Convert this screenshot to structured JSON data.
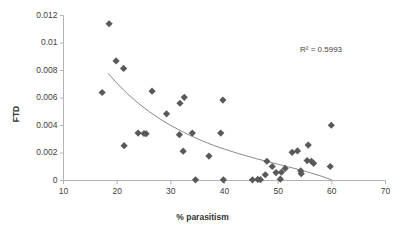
{
  "chart_data": {
    "type": "scatter",
    "title": "",
    "xlabel": "% parasitism",
    "ylabel": "FTD",
    "xlim": [
      10,
      70
    ],
    "ylim": [
      0,
      0.012
    ],
    "xticks": [
      10,
      20,
      30,
      40,
      50,
      60,
      70
    ],
    "yticks": [
      0,
      0.002,
      0.004,
      0.006,
      0.008,
      0.01,
      0.012
    ],
    "xtick_labels": [
      "10",
      "20",
      "30",
      "40",
      "50",
      "60",
      "70"
    ],
    "ytick_labels": [
      "0",
      "0.002",
      "0.004",
      "0.006",
      "0.008",
      "0.01",
      "0.012"
    ],
    "grid": false,
    "legend": null,
    "marker_color": "#595959",
    "marker_shape": "diamond",
    "trendline_color": "#7d7d7d",
    "annotations": [
      {
        "text": "R² = 0.5993",
        "x": 63.5,
        "y": 0.0098
      }
    ],
    "points": [
      {
        "x": 17.2,
        "y": 0.0064
      },
      {
        "x": 18.5,
        "y": 0.0114
      },
      {
        "x": 19.8,
        "y": 0.0087
      },
      {
        "x": 21.2,
        "y": 0.00815
      },
      {
        "x": 21.3,
        "y": 0.00253
      },
      {
        "x": 23.9,
        "y": 0.00345
      },
      {
        "x": 25.0,
        "y": 0.00342
      },
      {
        "x": 25.4,
        "y": 0.0034
      },
      {
        "x": 26.5,
        "y": 0.0065
      },
      {
        "x": 29.2,
        "y": 0.00485
      },
      {
        "x": 31.7,
        "y": 0.00562
      },
      {
        "x": 31.6,
        "y": 0.00333
      },
      {
        "x": 32.5,
        "y": 0.00605
      },
      {
        "x": 32.3,
        "y": 0.00213
      },
      {
        "x": 34.0,
        "y": 0.00345
      },
      {
        "x": 34.6,
        "y": 5e-05
      },
      {
        "x": 37.1,
        "y": 0.00178
      },
      {
        "x": 39.3,
        "y": 0.00345
      },
      {
        "x": 39.8,
        "y": 5e-05
      },
      {
        "x": 39.7,
        "y": 0.00585
      },
      {
        "x": 45.2,
        "y": 5e-05
      },
      {
        "x": 46.2,
        "y": 8e-05
      },
      {
        "x": 46.7,
        "y": 6e-05
      },
      {
        "x": 47.6,
        "y": 0.00042
      },
      {
        "x": 47.9,
        "y": 0.0014
      },
      {
        "x": 48.9,
        "y": 0.00102
      },
      {
        "x": 49.6,
        "y": 0.00058
      },
      {
        "x": 50.4,
        "y": 0.0001
      },
      {
        "x": 50.6,
        "y": 0.0006
      },
      {
        "x": 51.3,
        "y": 0.00088
      },
      {
        "x": 52.6,
        "y": 0.00205
      },
      {
        "x": 53.6,
        "y": 0.00215
      },
      {
        "x": 54.2,
        "y": 0.0007
      },
      {
        "x": 54.3,
        "y": 0.0005
      },
      {
        "x": 55.6,
        "y": 0.00258
      },
      {
        "x": 55.4,
        "y": 0.00145
      },
      {
        "x": 56.2,
        "y": 0.0014
      },
      {
        "x": 56.6,
        "y": 0.00125
      },
      {
        "x": 59.9,
        "y": 0.00402
      },
      {
        "x": 59.7,
        "y": 0.00102
      }
    ],
    "trendline": {
      "type": "power",
      "r_squared": 0.5993,
      "points": [
        {
          "x": 18.3,
          "y": 0.0078
        },
        {
          "x": 20.0,
          "y": 0.00705
        },
        {
          "x": 22.0,
          "y": 0.00628
        },
        {
          "x": 24.0,
          "y": 0.0056
        },
        {
          "x": 26.0,
          "y": 0.005
        },
        {
          "x": 28.0,
          "y": 0.00447
        },
        {
          "x": 30.0,
          "y": 0.004
        },
        {
          "x": 32.0,
          "y": 0.00358
        },
        {
          "x": 34.0,
          "y": 0.0032
        },
        {
          "x": 36.0,
          "y": 0.00286
        },
        {
          "x": 38.0,
          "y": 0.00255
        },
        {
          "x": 40.0,
          "y": 0.00228
        },
        {
          "x": 42.0,
          "y": 0.00203
        },
        {
          "x": 44.0,
          "y": 0.0018
        },
        {
          "x": 46.0,
          "y": 0.00158
        },
        {
          "x": 48.0,
          "y": 0.00138
        },
        {
          "x": 50.0,
          "y": 0.00118
        },
        {
          "x": 52.0,
          "y": 0.00098
        },
        {
          "x": 54.0,
          "y": 0.00078
        },
        {
          "x": 56.0,
          "y": 0.00056
        },
        {
          "x": 58.0,
          "y": 0.00032
        },
        {
          "x": 60.0,
          "y": 4e-05
        }
      ]
    }
  }
}
